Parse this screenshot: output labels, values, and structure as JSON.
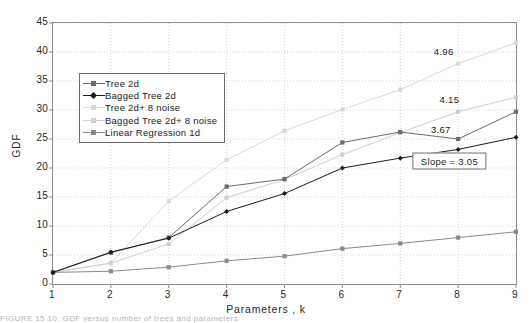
{
  "figure": {
    "background_color": "#ffffff",
    "caption_clipped": "FIGURE 15.10.  GDF versus number of trees and parameters"
  },
  "axes": {
    "x_title": "Parameters , k",
    "y_title": "GDF",
    "x_ticks": [
      "1",
      "2",
      "3",
      "4",
      "5",
      "6",
      "7",
      "8",
      "9"
    ],
    "y_ticks": [
      "0",
      "5",
      "10",
      "15",
      "20",
      "25",
      "30",
      "35",
      "40",
      "45"
    ],
    "frame_color": "#8c8c8c",
    "grid_color": "#c8c8c8"
  },
  "legend": {
    "border_color": "#6e6e6e",
    "items": [
      {
        "label": "Tree 2d",
        "color": "#6b6b6b",
        "marker": "square"
      },
      {
        "label": "Bagged Tree 2d",
        "color": "#1c1c1c",
        "marker": "diamond"
      },
      {
        "label": "Tree 2d+ 8 noise",
        "color": "#d9d9d9",
        "marker": "square"
      },
      {
        "label": "Bagged Tree 2d+ 8 noise",
        "color": "#cfcfcf",
        "marker": "square"
      },
      {
        "label": "Linear Regression 1d",
        "color": "#8a8a8a",
        "marker": "square"
      }
    ]
  },
  "annotations": [
    {
      "name": "label-496",
      "text": "4.96",
      "x": 7.75,
      "y": 40.2
    },
    {
      "name": "label-415",
      "text": "4.15",
      "x": 7.85,
      "y": 31.9
    },
    {
      "name": "label-367",
      "text": "3.67",
      "x": 7.7,
      "y": 26.8
    },
    {
      "name": "slope-box",
      "text": "Slope = 3.05",
      "x": 7.85,
      "y": 21.2
    }
  ],
  "chart_data": {
    "type": "line",
    "title": "",
    "xlabel": "Parameters , k",
    "ylabel": "GDF",
    "xlim": [
      1,
      9
    ],
    "ylim": [
      0,
      45
    ],
    "grid": true,
    "legend_position": "upper-left-inside",
    "x": [
      1,
      2,
      3,
      4,
      5,
      6,
      7,
      8,
      9
    ],
    "series": [
      {
        "name": "Tree 2d",
        "color": "#6b6b6b",
        "marker": "square",
        "values": [
          2.0,
          5.4,
          8.0,
          16.8,
          18.1,
          24.4,
          26.2,
          25.0,
          29.7
        ]
      },
      {
        "name": "Bagged Tree 2d",
        "color": "#1c1c1c",
        "marker": "diamond",
        "values": [
          2.0,
          5.5,
          7.9,
          12.5,
          15.6,
          20.0,
          21.7,
          23.2,
          25.3
        ]
      },
      {
        "name": "Tree 2d+ 8 noise",
        "color": "#d9d9d9",
        "marker": "square",
        "values": [
          2.0,
          3.6,
          14.3,
          21.4,
          26.4,
          30.1,
          33.5,
          38.0,
          41.6
        ]
      },
      {
        "name": "Bagged Tree 2d+ 8 noise",
        "color": "#cfcfcf",
        "marker": "square",
        "values": [
          2.0,
          3.6,
          6.9,
          14.9,
          18.0,
          22.3,
          26.1,
          29.7,
          32.2
        ]
      },
      {
        "name": "Linear Regression 1d",
        "color": "#8a8a8a",
        "marker": "square",
        "values": [
          2.0,
          2.2,
          2.9,
          4.0,
          4.8,
          6.1,
          7.0,
          8.0,
          9.0
        ]
      }
    ]
  }
}
